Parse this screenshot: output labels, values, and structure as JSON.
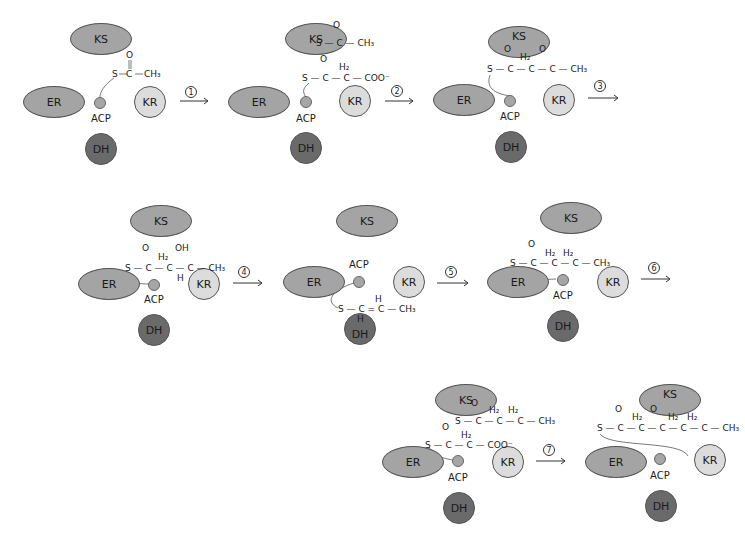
{
  "colors": {
    "KS": "#a4a4a4",
    "ER": "#a4a4a4",
    "KR": "#dcdcdc",
    "DH": "#6a6a6a",
    "ACP": "#a6a6a6"
  },
  "enzyme_labels": {
    "KS": "KS",
    "ER": "ER",
    "KR": "KR",
    "DH": "DH",
    "ACP": "ACP"
  },
  "steps": [
    {
      "number": "1"
    },
    {
      "number": "2"
    },
    {
      "number": "3"
    },
    {
      "number": "4"
    },
    {
      "number": "5"
    },
    {
      "number": "6"
    },
    {
      "number": "7"
    }
  ],
  "chem": {
    "S": "S",
    "C": "C",
    "O": "O",
    "H": "H",
    "OH": "OH",
    "H2": "H₂",
    "CH3": "CH₃",
    "COO": "COO⁻",
    "bond": "—",
    "dbond": "="
  },
  "stages": [
    {
      "id": "s1",
      "ks_group": "",
      "acp_group": "S—C(=O)—CH₃"
    },
    {
      "id": "s2",
      "ks_group": "S—C(=O)—CH₃",
      "acp_group": "S—C(=O)—CH₂—COO⁻"
    },
    {
      "id": "s3",
      "ks_group": "",
      "acp_group": "S—C(=O)—CH₂—C(=O)—CH₃"
    },
    {
      "id": "s4",
      "ks_group": "",
      "acp_group": "S—C(=O)—CH₂—CH(OH)—CH₃"
    },
    {
      "id": "s5",
      "ks_group": "",
      "acp_group": "S—CH=CH—CH₃"
    },
    {
      "id": "s6",
      "ks_group": "",
      "acp_group": "S—C(=O)—CH₂—CH₂—CH₃"
    },
    {
      "id": "s7",
      "ks_group": "S—C(=O)—CH₂—CH₂—CH₃",
      "acp_group": "S—C(=O)—CH₂—COO⁻"
    },
    {
      "id": "s8",
      "ks_group": "",
      "acp_group": "S—C(=O)—CH₂—C(=O)—CH₂—CH₂—CH₃"
    }
  ]
}
